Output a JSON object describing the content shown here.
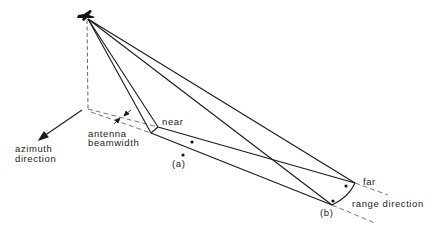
{
  "diagram": {
    "labels": {
      "azimuth_line1": "azimuth",
      "azimuth_line2": "direction",
      "antenna_line1": "antenna",
      "antenna_line2": "beamwidth",
      "near": "near",
      "far": "far",
      "range": "range direction",
      "point_a": "(a)",
      "point_b": "(b)"
    },
    "colors": {
      "line": "#1a1a1a",
      "dashed": "#555555",
      "background": "#ffffff"
    }
  }
}
